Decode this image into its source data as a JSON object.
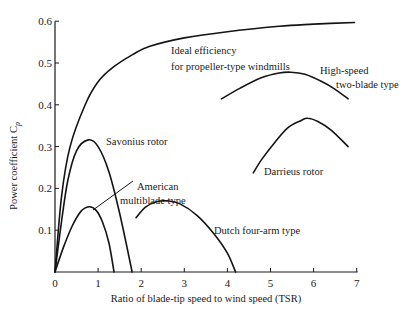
{
  "chart_data": {
    "type": "line",
    "title": "",
    "xlabel": "Ratio of blade-tip speed to wind speed (TSR)",
    "ylabel": "Power coefficient C",
    "ylabel_subscript": "p",
    "xlim": [
      0,
      7
    ],
    "ylim": [
      0,
      0.6
    ],
    "grid": false,
    "legend": "none (curves labeled directly)",
    "x_ticks": [
      "0",
      "1",
      "2",
      "3",
      "4",
      "5",
      "6",
      "7"
    ],
    "y_ticks": [
      "0.1",
      "0.2",
      "0.3",
      "0.4",
      "0.5",
      "0.6"
    ],
    "series": [
      {
        "name": "Ideal efficiency for propeller-type windmills",
        "label_lines": [
          "Ideal efficiency",
          "for propeller-type windmills"
        ],
        "x": [
          0,
          0.15,
          0.35,
          0.7,
          1.0,
          1.35,
          1.8,
          2.2,
          3.0,
          4.0,
          5.2,
          6.0,
          6.95
        ],
        "y": [
          0,
          0.18,
          0.3,
          0.4,
          0.455,
          0.49,
          0.52,
          0.54,
          0.56,
          0.575,
          0.588,
          0.593,
          0.597
        ]
      },
      {
        "name": "High-speed two-blade type",
        "label_lines": [
          "High-speed",
          "two-blade type"
        ],
        "x": [
          3.86,
          4.3,
          4.8,
          5.2,
          5.47,
          5.8,
          6.2,
          6.5,
          6.8
        ],
        "y": [
          0.414,
          0.44,
          0.465,
          0.476,
          0.478,
          0.473,
          0.455,
          0.437,
          0.414
        ]
      },
      {
        "name": "Darrieus rotor",
        "label_lines": [
          "Darrieus rotor"
        ],
        "x": [
          4.6,
          4.8,
          5.1,
          5.4,
          5.7,
          5.86,
          6.1,
          6.4,
          6.8
        ],
        "y": [
          0.237,
          0.27,
          0.31,
          0.345,
          0.362,
          0.368,
          0.36,
          0.34,
          0.3
        ]
      },
      {
        "name": "Savonius rotor",
        "label_lines": [
          "Savonius rotor"
        ],
        "x": [
          0,
          0.15,
          0.3,
          0.5,
          0.77,
          1.0,
          1.25,
          1.5,
          1.79
        ],
        "y": [
          0,
          0.12,
          0.22,
          0.29,
          0.316,
          0.3,
          0.24,
          0.14,
          0
        ]
      },
      {
        "name": "American multiblade type",
        "label_lines": [
          "American",
          "multiblade type"
        ],
        "x": [
          0,
          0.2,
          0.4,
          0.6,
          0.79,
          0.95,
          1.1,
          1.25,
          1.37
        ],
        "y": [
          0,
          0.06,
          0.11,
          0.145,
          0.156,
          0.148,
          0.12,
          0.07,
          0
        ]
      },
      {
        "name": "Dutch four-arm type",
        "label_lines": [
          "Dutch four-arm type"
        ],
        "x": [
          1.88,
          2.1,
          2.35,
          2.6,
          2.9,
          3.3,
          3.7,
          4.0,
          4.19
        ],
        "y": [
          0.13,
          0.155,
          0.168,
          0.17,
          0.163,
          0.135,
          0.09,
          0.045,
          0
        ]
      }
    ]
  }
}
